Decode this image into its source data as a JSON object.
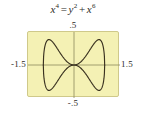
{
  "figure": {
    "equation": {
      "lhs_base": "x",
      "lhs_exp": "4",
      "relation": "=",
      "rhs_term1_base": "y",
      "rhs_term1_exp": "2",
      "operator": "+",
      "rhs_term2_base": "x",
      "rhs_term2_exp": "6",
      "plain_text": "x4 = y2 + x6"
    },
    "viewport": {
      "background_color": "#f4f1b4",
      "border_color": "#cfc98a",
      "curve_color": "#3a3220",
      "axis_color": "#8d8a5e"
    },
    "labels": {
      "y_max": ".5",
      "y_min": "-.5",
      "x_min": "-1.5",
      "x_max": "1.5"
    }
  },
  "chart_data": {
    "type": "line",
    "xlabel": "",
    "ylabel": "",
    "xlim": [
      -1.5,
      1.5
    ],
    "ylim": [
      -0.5,
      0.5
    ],
    "xticks": [
      -1.5,
      1.5
    ],
    "yticks": [
      -0.5,
      0.5
    ],
    "xticklabels": [
      "-1.5",
      "1.5"
    ],
    "yticklabels": [
      "-.5",
      ".5"
    ],
    "grid": false,
    "legend": false,
    "axes_shown": [
      "x-axis",
      "y-axis"
    ],
    "series": [
      {
        "name": "upper branch y = x^2*sqrt(1-x^2)",
        "x": [
          -1.0,
          -0.95,
          -0.9,
          -0.85,
          -0.8,
          -0.75,
          -0.707,
          -0.65,
          -0.6,
          -0.5,
          -0.4,
          -0.3,
          -0.2,
          -0.1,
          0.0,
          0.1,
          0.2,
          0.3,
          0.4,
          0.5,
          0.6,
          0.65,
          0.707,
          0.75,
          0.8,
          0.85,
          0.9,
          0.95,
          1.0
        ],
        "y": [
          0.0,
          0.282,
          0.353,
          0.381,
          0.384,
          0.372,
          0.354,
          0.321,
          0.288,
          0.217,
          0.147,
          0.086,
          0.039,
          0.01,
          0.0,
          0.01,
          0.039,
          0.086,
          0.147,
          0.217,
          0.288,
          0.321,
          0.354,
          0.372,
          0.384,
          0.381,
          0.353,
          0.282,
          0.0
        ]
      },
      {
        "name": "lower branch y = -x^2*sqrt(1-x^2)",
        "x": [
          -1.0,
          -0.95,
          -0.9,
          -0.85,
          -0.8,
          -0.75,
          -0.707,
          -0.65,
          -0.6,
          -0.5,
          -0.4,
          -0.3,
          -0.2,
          -0.1,
          0.0,
          0.1,
          0.2,
          0.3,
          0.4,
          0.5,
          0.6,
          0.65,
          0.707,
          0.75,
          0.8,
          0.85,
          0.9,
          0.95,
          1.0
        ],
        "y": [
          0.0,
          -0.282,
          -0.353,
          -0.381,
          -0.384,
          -0.372,
          -0.354,
          -0.321,
          -0.288,
          -0.217,
          -0.147,
          -0.086,
          -0.039,
          -0.01,
          0.0,
          -0.01,
          -0.039,
          -0.086,
          -0.147,
          -0.217,
          -0.288,
          -0.321,
          -0.354,
          -0.372,
          -0.384,
          -0.381,
          -0.353,
          -0.282,
          0.0
        ]
      }
    ]
  }
}
